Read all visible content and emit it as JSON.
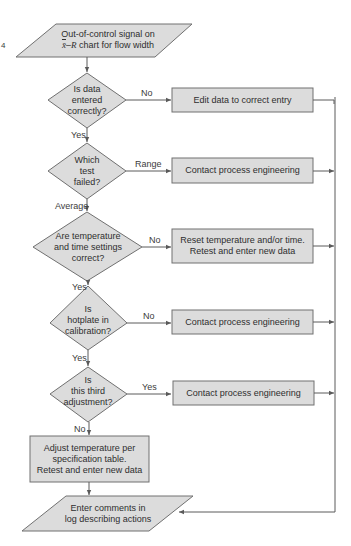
{
  "diagram": {
    "type": "flowchart",
    "colors": {
      "fill": "#dcdcdc",
      "stroke": "#707070",
      "line": "#5a5a5a",
      "background": "#ffffff"
    },
    "margin_mark": "4",
    "start": {
      "line1": "Out-of-control signal on",
      "line2_prefix_symbol": "x̄",
      "line2_dash": "–",
      "line2_symbol": "R",
      "line2_rest": " chart for flow width"
    },
    "decisions": [
      {
        "id": "d1",
        "lines": [
          "Is data",
          "entered",
          "correctly?"
        ],
        "side_label": "No",
        "down_label": "Yes"
      },
      {
        "id": "d2",
        "lines": [
          "Which",
          "test",
          "failed?"
        ],
        "side_label": "Range",
        "down_label": "Average"
      },
      {
        "id": "d3",
        "lines": [
          "Are temperature",
          "and time settings",
          "correct?"
        ],
        "side_label": "No",
        "down_label": "Yes"
      },
      {
        "id": "d4",
        "lines": [
          "Is",
          "hotplate in",
          "calibration?"
        ],
        "side_label": "No",
        "down_label": "Yes"
      },
      {
        "id": "d5",
        "lines": [
          "Is",
          "this third",
          "adjustment?"
        ],
        "side_label": "Yes",
        "down_label": "No"
      }
    ],
    "actions": [
      {
        "id": "a1",
        "lines": [
          "Edit data to correct entry"
        ]
      },
      {
        "id": "a2",
        "lines": [
          "Contact process engineering"
        ]
      },
      {
        "id": "a3",
        "lines": [
          "Reset temperature and/or time.",
          "Retest and enter new data"
        ]
      },
      {
        "id": "a4",
        "lines": [
          "Contact process engineering"
        ]
      },
      {
        "id": "a5",
        "lines": [
          "Contact process engineering"
        ]
      },
      {
        "id": "a6",
        "lines": [
          "Adjust temperature per",
          "specification table.",
          "Retest and enter new data"
        ]
      }
    ],
    "end": {
      "lines": [
        "Enter comments in",
        "log describing actions"
      ]
    }
  }
}
